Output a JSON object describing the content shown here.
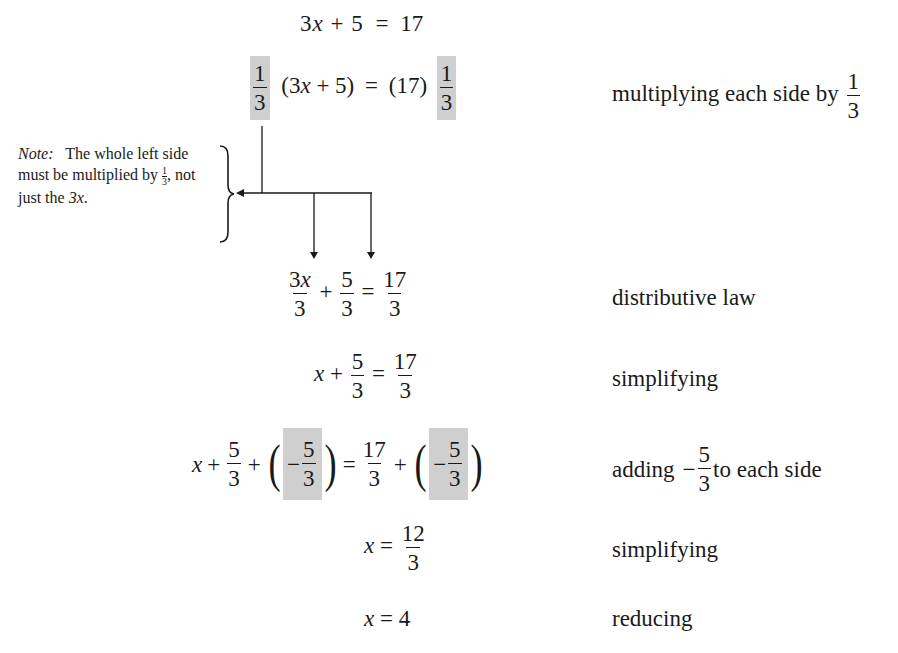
{
  "steps": [
    {
      "id": "s1",
      "equation": {
        "lhs": "3x + 5",
        "rhs": "17"
      },
      "label": ""
    },
    {
      "id": "s2",
      "equation": {
        "lhs_factor": {
          "num": "1",
          "den": "3",
          "shaded": true
        },
        "lhs": "(3x + 5)",
        "rhs": "(17)",
        "rhs_factor": {
          "num": "1",
          "den": "3",
          "shaded": true
        }
      },
      "label": "multiplying each side by",
      "label_frac": {
        "num": "1",
        "den": "3"
      }
    },
    {
      "id": "s3",
      "equation": {
        "t1": {
          "num": "3x",
          "den": "3"
        },
        "op": "+",
        "t2": {
          "num": "5",
          "den": "3"
        },
        "rhs": {
          "num": "17",
          "den": "3"
        }
      },
      "label": "distributive law"
    },
    {
      "id": "s4",
      "equation": {
        "lhs_var": "x",
        "op": "+",
        "t2": {
          "num": "5",
          "den": "3"
        },
        "rhs": {
          "num": "17",
          "den": "3"
        }
      },
      "label": "simplifying"
    },
    {
      "id": "s5",
      "equation": {
        "lhs_var": "x",
        "t2": {
          "num": "5",
          "den": "3"
        },
        "added": {
          "sign": "−",
          "num": "5",
          "den": "3",
          "shaded": true
        },
        "rhs": {
          "num": "17",
          "den": "3"
        }
      },
      "label_prefix": "adding",
      "label_frac": {
        "sign": "−",
        "num": "5",
        "den": "3"
      },
      "label_suffix": "to each side"
    },
    {
      "id": "s6",
      "equation": {
        "lhs_var": "x",
        "rhs": {
          "num": "12",
          "den": "3"
        }
      },
      "label": "simplifying"
    },
    {
      "id": "s7",
      "equation": {
        "lhs_var": "x",
        "rhs": "4"
      },
      "label": "reducing"
    }
  ],
  "note": {
    "prefix": "Note:",
    "text": "The whole left side must be multiplied by",
    "frac": {
      "num": "1",
      "den": "3"
    },
    "suffix": ", not just the",
    "var": "3x",
    "end": "."
  },
  "symbols": {
    "plus": "+",
    "equals": "=",
    "lparen": "(",
    "rparen": ")"
  },
  "colors": {
    "shade": "#cfcfcf",
    "ink": "#1a1a1a",
    "background": "#ffffff"
  }
}
